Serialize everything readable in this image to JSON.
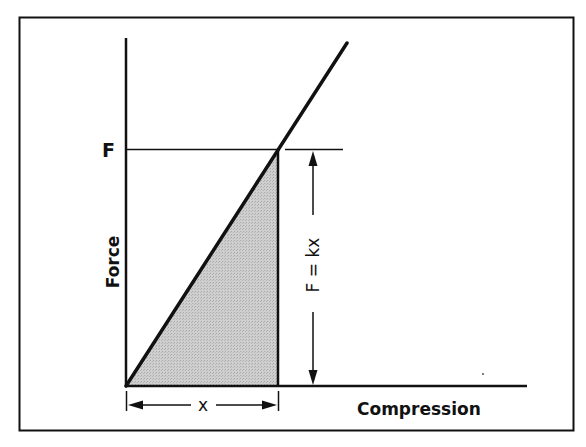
{
  "figure": {
    "type": "force-compression diagram (Hooke's law)",
    "colors": {
      "background": "#ffffff",
      "ink": "#111111",
      "shaded_area": "#c8c8c8"
    }
  },
  "axes": {
    "y_label": "Force",
    "x_label": "Compression"
  },
  "labels": {
    "force_level": "F",
    "equation": "F = kx",
    "displacement": "x"
  },
  "annotations": {
    "shaded_region": "triangle under line from 0 to x (work / stored energy)",
    "vertical_dimension": "F = kx arrow spanning from axis to F",
    "horizontal_dimension": "x arrow spanning from origin to compression x"
  }
}
